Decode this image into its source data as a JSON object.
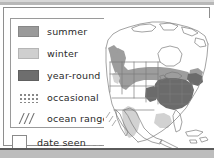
{
  "document": {
    "type": "range-map-worksheet",
    "title": "Bird range map legend"
  },
  "legend": {
    "items": [
      {
        "key": "summer",
        "label": "summer",
        "swatch": "solid-fill",
        "color": "#9a9a9a"
      },
      {
        "key": "winter",
        "label": "winter",
        "swatch": "solid-fill",
        "color": "#cfcfcf"
      },
      {
        "key": "year-round",
        "label": "year-round",
        "swatch": "solid-fill",
        "color": "#6e6e6e"
      },
      {
        "key": "occasional",
        "label": "occasional",
        "swatch": "dot-pattern",
        "color": "#888888"
      },
      {
        "key": "ocean-range",
        "label": "ocean range",
        "swatch": "diagonal-hatch",
        "color": "#6f6f6f"
      }
    ]
  },
  "date_seen": {
    "label": "date seen",
    "checkbox_checked": false,
    "value": "",
    "line_style": "dotted"
  },
  "map": {
    "region": "North America",
    "background": "#ffffff",
    "outline_color": "#7d7d7d",
    "shading": {
      "summer": "#9a9a9a",
      "winter": "#cfcfcf",
      "year_round": "#6e6e6e"
    }
  },
  "colors": {
    "chrome_bar": "#bdbdbd",
    "panel_border": "#8e8e8e",
    "text": "#2a2a2a"
  }
}
